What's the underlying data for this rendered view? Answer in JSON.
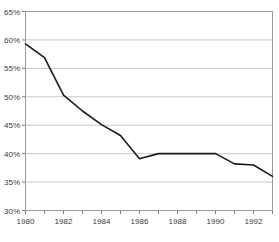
{
  "chart_data": {
    "type": "line",
    "title": "",
    "xlabel": "",
    "ylabel": "",
    "x": [
      1980,
      1981,
      1982,
      1983,
      1984,
      1985,
      1986,
      1987,
      1988,
      1989,
      1990,
      1991,
      1992,
      1993
    ],
    "values": [
      59.3,
      56.9,
      50.3,
      47.5,
      45.1,
      43.2,
      39.1,
      40.0,
      40.0,
      40.0,
      40.0,
      38.2,
      38.0,
      36.0
    ],
    "series": [
      {
        "name": "series-1",
        "values": [
          59.3,
          56.9,
          50.3,
          47.5,
          45.1,
          43.2,
          39.1,
          40.0,
          40.0,
          40.0,
          40.0,
          38.2,
          38.0,
          36.0
        ],
        "color": "#1a1a1a"
      }
    ],
    "ylim": [
      30,
      65
    ],
    "xlim": [
      1980,
      1993
    ],
    "ytick_values": [
      30,
      35,
      40,
      45,
      50,
      55,
      60,
      65
    ],
    "ytick_labels": [
      "30%",
      "35%",
      "40%",
      "45%",
      "50%",
      "55%",
      "60%",
      "65%"
    ],
    "xtick_values": [
      1980,
      1981,
      1982,
      1983,
      1984,
      1985,
      1986,
      1987,
      1988,
      1989,
      1990,
      1991,
      1992,
      1993
    ],
    "xtick_labels": [
      "1980",
      "",
      "1982",
      "",
      "1984",
      "",
      "1986",
      "",
      "1988",
      "",
      "1990",
      "",
      "1992",
      ""
    ],
    "grid": "horizontal",
    "legend": "none",
    "annotations": []
  },
  "style": {
    "line_color": "#1a1a1a",
    "grid_color": "#c8c8c8",
    "axis_color": "#7a7a7a",
    "frame_color": "#9a9a9a",
    "tick_text_color": "#3a3a3a",
    "background": "#ffffff"
  },
  "clipped": {
    "top_fragment": "",
    "bottom_fragment": ""
  }
}
